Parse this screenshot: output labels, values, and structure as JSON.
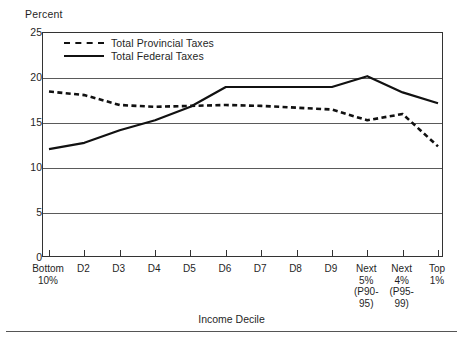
{
  "chart_data": {
    "type": "line",
    "title": "",
    "ylabel": "Percent",
    "xlabel": "Income Decile",
    "ylim": [
      0,
      25
    ],
    "yticks": [
      "0",
      "5",
      "10",
      "15",
      "20",
      "25"
    ],
    "ytick_values": [
      0,
      5,
      10,
      15,
      20,
      25
    ],
    "grid": "horizontal",
    "legend_position": "top-left-inside",
    "categories": [
      "Bottom\n10%",
      "D2",
      "D3",
      "D4",
      "D5",
      "D6",
      "D7",
      "D8",
      "D9",
      "Next\n5%\n(P90-\n95)",
      "Next\n4%\n(P95-\n99)",
      "Top\n1%"
    ],
    "series": [
      {
        "name": "Total Provincial Taxes",
        "style": "dashed",
        "color": "#111111",
        "values": [
          18.5,
          18.1,
          17.0,
          16.8,
          16.9,
          17.0,
          16.9,
          16.7,
          16.5,
          15.3,
          16.0,
          12.4
        ]
      },
      {
        "name": "Total Federal Taxes",
        "style": "solid",
        "color": "#111111",
        "values": [
          12.1,
          12.8,
          14.2,
          15.3,
          16.8,
          19.0,
          19.0,
          19.0,
          19.0,
          20.2,
          18.4,
          17.2
        ]
      }
    ]
  },
  "legend": {
    "items": [
      {
        "label": "Total Provincial Taxes",
        "style": "dashed"
      },
      {
        "label": "Total Federal Taxes",
        "style": "solid"
      }
    ]
  },
  "axes": {
    "y_title": "Percent",
    "x_title": "Income Decile"
  }
}
